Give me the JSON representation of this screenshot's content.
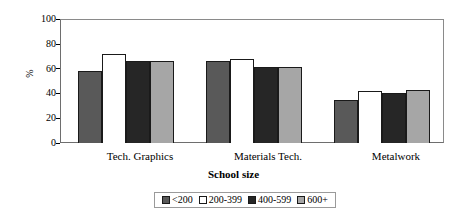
{
  "chart_data": {
    "type": "bar",
    "title": "",
    "subtitle": "",
    "xlabel": "School size",
    "ylabel": "%",
    "categories": [
      "Tech. Graphics",
      "Materials Tech.",
      "Metalwork"
    ],
    "series": [
      {
        "name": "<200",
        "values": [
          58,
          66,
          35
        ],
        "color": "#595959"
      },
      {
        "name": "200-399",
        "values": [
          72,
          68,
          42
        ],
        "color": "#ffffff"
      },
      {
        "name": "400-599",
        "values": [
          66,
          61,
          40
        ],
        "color": "#262626"
      },
      {
        "name": "600+",
        "values": [
          66,
          61,
          43
        ],
        "color": "#a6a6a6"
      }
    ],
    "ylim": [
      0,
      100
    ],
    "yticks": [
      0,
      20,
      40,
      60,
      80,
      100
    ],
    "ytick_labels": [
      "0",
      "20",
      "40",
      "60",
      "80",
      "100"
    ],
    "grid": false,
    "legend_position": "bottom",
    "legend_entries": [
      "<200",
      "200-399",
      "400-599",
      "600+"
    ]
  },
  "axis": {
    "y_title": "%",
    "x_title": "School size"
  }
}
